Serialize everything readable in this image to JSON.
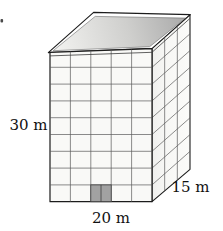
{
  "figure": {
    "kind": "building-prism-diagram",
    "labels": {
      "height": "30 m",
      "width": "20 m",
      "depth": "15 m"
    },
    "building": {
      "front_columns": 5,
      "front_rows": 9,
      "side_columns": 3,
      "door_panels": 2
    },
    "colors": {
      "background": "#ffffff",
      "outline": "#1c1c1c",
      "grid_line": "#5a5a5a",
      "slab_line": "#3a3a3a",
      "front_face": "#f9f9f7",
      "side_face": "#f5f5f3",
      "roof_light": "#efefed",
      "roof_dark": "#acacac",
      "door_fill": "#a2a2a2",
      "door_edge": "#3c3c3c",
      "label_color": "#111111"
    }
  }
}
